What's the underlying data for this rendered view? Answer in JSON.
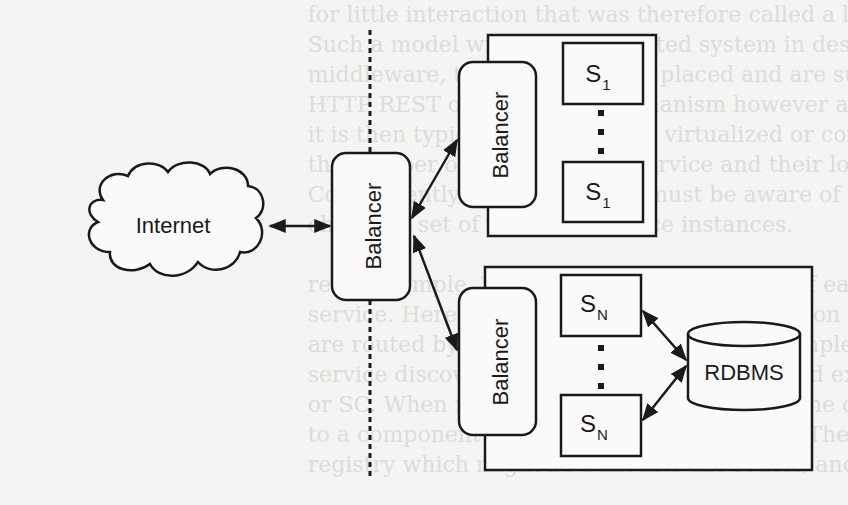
{
  "diagram": {
    "internet": {
      "label": "Internet"
    },
    "central_balancer": {
      "label": "Balancer"
    },
    "top_cluster": {
      "balancer": {
        "label": "Balancer"
      },
      "servers": [
        {
          "label": "S",
          "subscript": "1"
        },
        {
          "label": "S",
          "subscript": "1"
        }
      ]
    },
    "bottom_cluster": {
      "balancer": {
        "label": "Balancer"
      },
      "servers": [
        {
          "label": "S",
          "subscript": "N"
        },
        {
          "label": "S",
          "subscript": "N"
        }
      ],
      "database": {
        "label": "RDBMS"
      }
    },
    "colors": {
      "stroke": "#1a1a1a",
      "background": "#f4f4f2",
      "bleed_text": "#dcdcda"
    }
  },
  "background_text": {
    "lines": [
      "                                            for little interaction that was therefore called a light-weight or, alternatively, the",
      "                                            Such a model with one distributed system in design comes a service runtime",
      "                                            middleware, they can be easily placed and are supported and they can easily and",
      "                                            HTTP REST or some RPC mechanism however a model of services",
      "                                            it is then typically running on a virtualized or containerized environment that",
      "                                            the number of instances of a service and their locations may be dynamic.",
      "                                            Consequently, a service client must be aware of this dynamically",
      "                                            changing set of transient service instances.",
      "",
      "                                            remain simple. The clients use the location of each service instance by one request",
      "                                            service. Here, a platform handles the allocation of all service instances. Clients",
      "                                            are routed by the Service Registry and the implementation of a cluster",
      "                                            service discovery is modeled with generic and external services (see Fig. 3)",
      "                                            or SC. When making a request to a service, the client makes a request",
      "                                            to a component that acts as a load balancer. The router queries the",
      "                                            registry which might be built into the router, and forwards the request"
    ]
  }
}
